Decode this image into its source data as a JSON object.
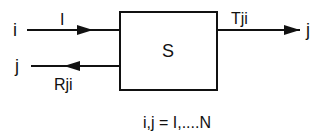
{
  "diagram": {
    "block_label": "S",
    "input_port_label": "i",
    "input_signal_label": "I",
    "reflected_port_label": "j",
    "reflected_signal_label": "Rji",
    "output_signal_label": "Tji",
    "output_port_label": "j",
    "caption": "i,j = I,....N"
  },
  "colors": {
    "stroke": "#111111",
    "background": "#ffffff"
  }
}
